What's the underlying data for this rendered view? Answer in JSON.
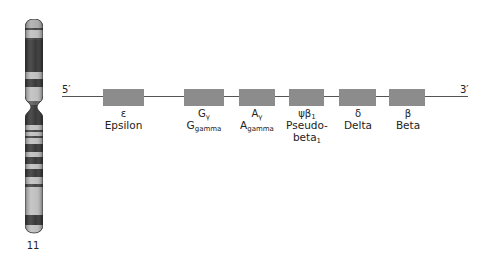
{
  "figure": {
    "chromosome": {
      "label": "11",
      "bands_description": "Ideogram of chromosome 11 with alternating light/dark G-bands and a centromere constriction"
    },
    "strand": {
      "five_prime_label": "5′",
      "three_prime_label": "3′"
    },
    "genes": [
      {
        "symbol": "ε",
        "symbol_sub": "",
        "name": "Epsilon",
        "name_sub": "",
        "name_line2": "",
        "name_line2_sub": "",
        "x": 103,
        "width": 41
      },
      {
        "symbol": "G",
        "symbol_sub": "γ",
        "name": "G",
        "name_sub": "gamma",
        "name_line2": "",
        "name_line2_sub": "",
        "x": 184,
        "width": 40
      },
      {
        "symbol": "A",
        "symbol_sub": "γ",
        "name": "A",
        "name_sub": "gamma",
        "name_line2": "",
        "name_line2_sub": "",
        "x": 239,
        "width": 36
      },
      {
        "symbol": "ψβ",
        "symbol_sub": "1",
        "name": "Pseudo-",
        "name_sub": "",
        "name_line2": "beta",
        "name_line2_sub": "1",
        "x": 289,
        "width": 35
      },
      {
        "symbol": "δ",
        "symbol_sub": "",
        "name": "Delta",
        "name_sub": "",
        "name_line2": "",
        "name_line2_sub": "",
        "x": 339,
        "width": 37
      },
      {
        "symbol": "β",
        "symbol_sub": "",
        "name": "Beta",
        "name_sub": "",
        "name_line2": "",
        "name_line2_sub": "",
        "x": 389,
        "width": 36
      }
    ],
    "colors": {
      "gene_box": "#8c8c8c",
      "line": "#555555",
      "band_dark": "#3a3a3a",
      "band_light": "#bdbdbd"
    }
  }
}
